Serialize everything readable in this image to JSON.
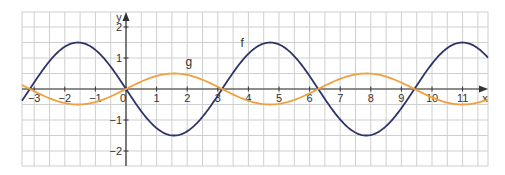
{
  "chart_data": {
    "type": "line",
    "title": "",
    "xlabel": "x",
    "ylabel": "y",
    "xlim": [
      -3.4,
      11.9
    ],
    "ylim": [
      -2.5,
      2.5
    ],
    "grid": true,
    "grid_step": 0.5,
    "x_ticks": [
      -3,
      -2,
      -1,
      0,
      1,
      2,
      3,
      4,
      5,
      6,
      7,
      8,
      9,
      10,
      11
    ],
    "x_tick_labels": [
      "−3",
      "−2",
      "−1",
      "0",
      "1",
      "2",
      "3",
      "4",
      "5",
      "6",
      "7",
      "8",
      "9",
      "10",
      "11"
    ],
    "y_ticks": [
      -2,
      -1,
      1,
      2
    ],
    "y_tick_labels": [
      "−2",
      "−1",
      "1",
      "2"
    ],
    "series": [
      {
        "name": "f",
        "label": "f",
        "formula": "-1.5*sin(x)",
        "color": "#2e3566",
        "amplitude": 1.5,
        "label_pos": [
          3.8,
          1.35
        ],
        "sample_points": [
          {
            "x": -3.1416,
            "y": 0
          },
          {
            "x": -1.5708,
            "y": 1.5
          },
          {
            "x": 0,
            "y": 0
          },
          {
            "x": 1.5708,
            "y": -1.5
          },
          {
            "x": 3.1416,
            "y": 0
          },
          {
            "x": 4.7124,
            "y": 1.5
          },
          {
            "x": 6.2832,
            "y": 0
          },
          {
            "x": 7.854,
            "y": -1.5
          },
          {
            "x": 9.4248,
            "y": 0
          },
          {
            "x": 10.9956,
            "y": 1.5
          }
        ]
      },
      {
        "name": "g",
        "label": "g",
        "formula": "0.5*sin(x)",
        "color": "#f0a040",
        "amplitude": 0.5,
        "label_pos": [
          2.05,
          0.75
        ],
        "sample_points": [
          {
            "x": -3.1416,
            "y": 0
          },
          {
            "x": -1.5708,
            "y": -0.5
          },
          {
            "x": 0,
            "y": 0
          },
          {
            "x": 1.5708,
            "y": 0.5
          },
          {
            "x": 3.1416,
            "y": 0
          },
          {
            "x": 4.7124,
            "y": -0.5
          },
          {
            "x": 6.2832,
            "y": 0
          },
          {
            "x": 7.854,
            "y": 0.5
          },
          {
            "x": 9.4248,
            "y": 0
          },
          {
            "x": 10.9956,
            "y": -0.5
          }
        ]
      }
    ],
    "colors": {
      "grid": "#cfcfcf",
      "axis": "#333333"
    }
  }
}
